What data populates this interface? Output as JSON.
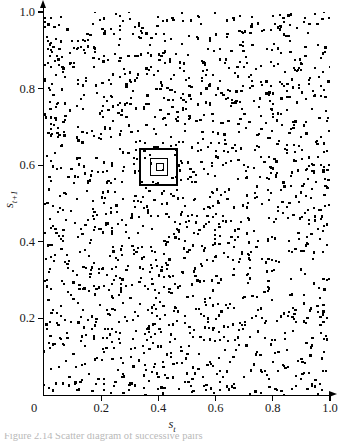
{
  "figure": {
    "title": "",
    "caption_partial": "Figure   2.14  Scatter  diagram  of  successive  pairs"
  },
  "axes": {
    "xlabel": "s",
    "xlabel_sub": "t",
    "ylabel": "s",
    "ylabel_sub": "t+1",
    "xticks": [
      "0",
      "0.2",
      "0.4",
      "0.6",
      "0.8",
      "1.0"
    ],
    "yticks": [
      "0.2",
      "0.4",
      "0.6",
      "0.8",
      "1.0"
    ],
    "xtick_values": [
      0,
      0.2,
      0.4,
      0.6,
      0.8,
      1.0
    ],
    "ytick_values": [
      0.2,
      0.4,
      0.6,
      0.8,
      1.0
    ],
    "xlim": [
      0,
      1.0
    ],
    "ylim": [
      0,
      1.0
    ],
    "grid": false,
    "arrowheads": true
  },
  "chart_data": {
    "type": "scatter",
    "title": "",
    "xlabel": "s_t",
    "ylabel": "s_{t+1}",
    "xlim": [
      0,
      1.0
    ],
    "ylim": [
      0,
      1.0
    ],
    "xticks": [
      0,
      0.2,
      0.4,
      0.6,
      0.8,
      1.0
    ],
    "yticks": [
      0,
      0.2,
      0.4,
      0.6,
      0.8,
      1.0
    ],
    "xticklabels": [
      "0",
      "0.2",
      "0.4",
      "0.6",
      "0.8",
      "1.0"
    ],
    "yticklabels": [
      "0",
      "0.2",
      "0.4",
      "0.6",
      "0.8",
      "1.0"
    ],
    "grid": false,
    "legend": null,
    "marker": "square",
    "marker_size_px": 2.2,
    "color": "#000000",
    "n_points": 1600,
    "point_distribution": "uniform-random",
    "annotations": [
      {
        "type": "rect",
        "name": "zoom-box-level-1",
        "x0": 0.333,
        "y0": 0.545,
        "x1": 0.47,
        "y1": 0.645,
        "stroke": "#000000",
        "fill": "none"
      },
      {
        "type": "rect",
        "name": "zoom-box-level-2",
        "x0": 0.372,
        "y0": 0.573,
        "x1": 0.435,
        "y1": 0.618,
        "stroke": "#000000",
        "fill": "none"
      },
      {
        "type": "rect",
        "name": "zoom-box-level-3",
        "x0": 0.39,
        "y0": 0.584,
        "x1": 0.418,
        "y1": 0.605,
        "stroke": "#000000",
        "fill": "none"
      }
    ]
  }
}
